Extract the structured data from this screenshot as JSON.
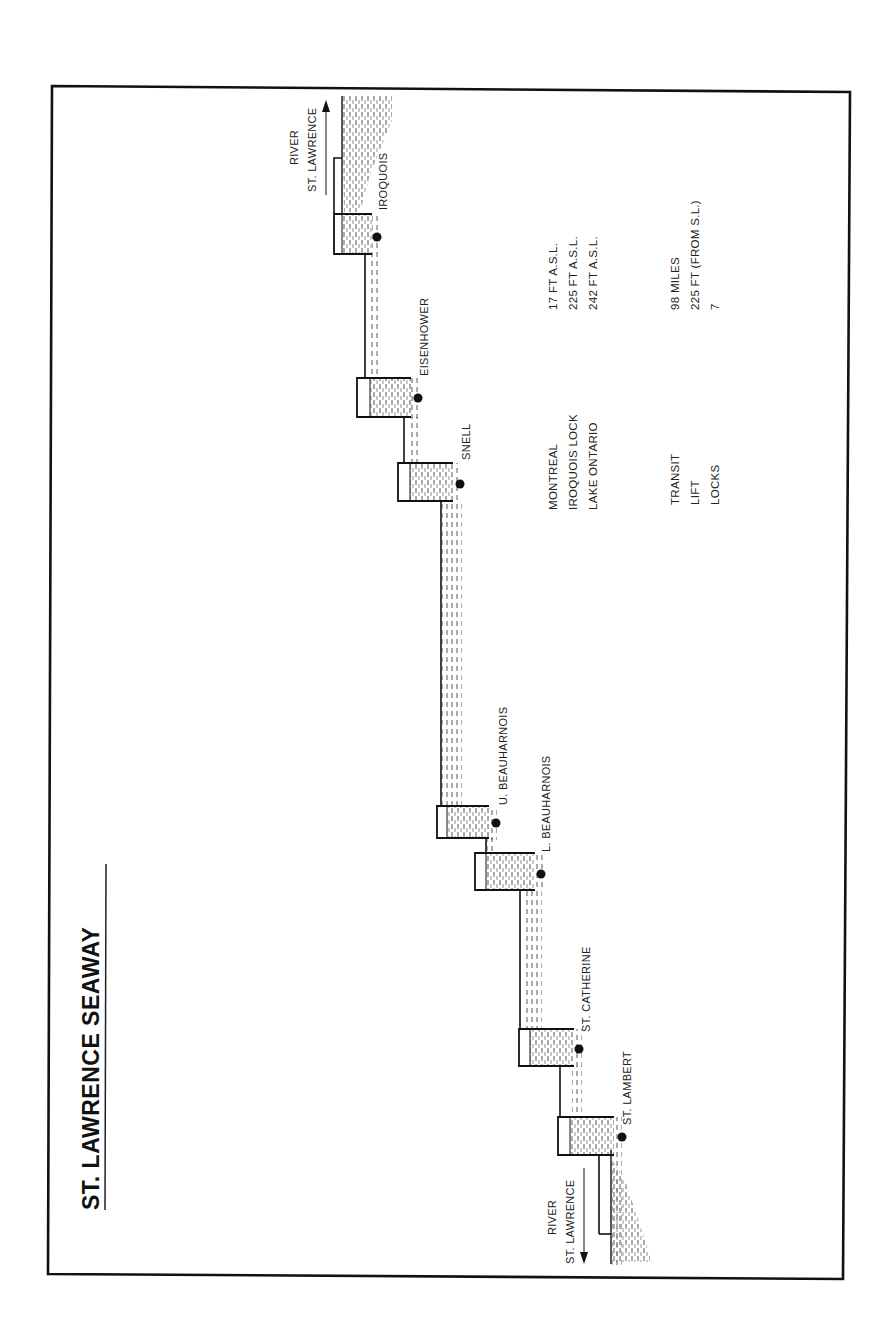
{
  "title": "ST. LAWRENCE SEAWAY",
  "colors": {
    "ink": "#1a1a1a",
    "water": "#555555",
    "paper": "#ffffff"
  },
  "river_top": {
    "line1": "RIVER",
    "line2": "ST. LAWRENCE",
    "arrow": "up-arrow"
  },
  "river_bottom": {
    "line1": "RIVER",
    "line2": "ST. LAWRENCE",
    "arrow": "down-arrow"
  },
  "locks": [
    {
      "name": "IROQUOIS"
    },
    {
      "name": "EISENHOWER"
    },
    {
      "name": "SNELL"
    },
    {
      "name": "U. BEAUHARNOIS"
    },
    {
      "name": "L. BEAUHARNOIS"
    },
    {
      "name": "ST. CATHERINE"
    },
    {
      "name": "ST. LAMBERT"
    }
  ],
  "elevations": [
    {
      "place": "MONTREAL",
      "value": "17 FT A.S.L."
    },
    {
      "place": "IROQUOIS LOCK",
      "value": "225 FT A.S.L."
    },
    {
      "place": "LAKE ONTARIO",
      "value": "242 FT A.S.L."
    }
  ],
  "stats": [
    {
      "label": "TRANSIT",
      "value": "98  MILES"
    },
    {
      "label": "LIFT",
      "value": "225 FT (FROM S.L.)"
    },
    {
      "label": "LOCKS",
      "value": "7"
    }
  ]
}
